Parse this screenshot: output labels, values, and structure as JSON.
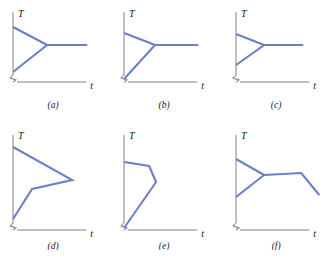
{
  "figure": {
    "type": "multi-panel-line-diagram",
    "panel_count": 6,
    "axis_color": "#808080",
    "curve_color": "#6b80c8",
    "label_color": "#1a1a1a",
    "background": "#ffffff",
    "caption": ""
  },
  "panels": [
    {
      "id": "a",
      "label": "(a)",
      "ylabel": "T",
      "xlabel": "t",
      "axis_break": true,
      "curve_points": "13,27 47,45 13,72",
      "curve_extra": "47,45 87,45",
      "description": "two segments from y-axis meeting at a vertex, then horizontal line to the right"
    },
    {
      "id": "b",
      "label": "(b)",
      "ylabel": "T",
      "xlabel": "t",
      "axis_break": true,
      "curve_points": "13,33 44,45 13,79",
      "curve_extra": "44,45 87,45",
      "description": "upper short segment and lower long segment from axis to vertex, then horizontal line"
    },
    {
      "id": "c",
      "label": "(c)",
      "ylabel": "T",
      "xlabel": "t",
      "axis_break": true,
      "curve_points": "13,34 41,45 13,65",
      "curve_extra": "41,45 80,45",
      "description": "narrow triangle from axis to vertex, then horizontal line to the right"
    },
    {
      "id": "d",
      "label": "(d)",
      "ylabel": "T",
      "xlabel": "t",
      "axis_break": true,
      "curve_points": "13,22 72,55 32,64 13,94",
      "curve_extra": "",
      "description": "concave arrow shape, four vertices, open to the left"
    },
    {
      "id": "e",
      "label": "(e)",
      "ylabel": "T",
      "xlabel": "t",
      "axis_break": true,
      "curve_points": "13,37 38,41 45,57 13,103",
      "curve_extra": "",
      "description": "narrow wedge rising from the origin to a vertex then back to the axis"
    },
    {
      "id": "f",
      "label": "(f)",
      "ylabel": "T",
      "xlabel": "t",
      "axis_break": true,
      "curve_points": "13,34 41,50 13,72",
      "curve_extra": "41,50 78,48 96,70",
      "description": "triangle then near-horizontal segment then descending diagonal"
    }
  ]
}
